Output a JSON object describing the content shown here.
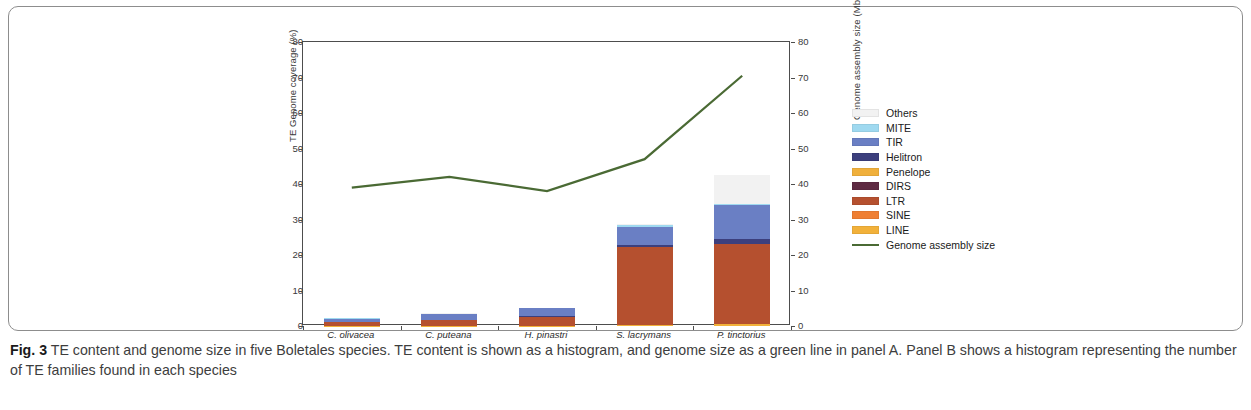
{
  "figure": {
    "caption_label": "Fig. 3",
    "caption_text": " TE content and genome size in five Boletales species. TE content is shown as a histogram, and genome size as a green line in panel A. Panel B shows a histogram representing the number of TE families found in each species"
  },
  "legend": {
    "items": [
      {
        "label": "Others",
        "color": "#f2f2f2"
      },
      {
        "label": "MITE",
        "color": "#9fd9f0"
      },
      {
        "label": "TIR",
        "color": "#6a7fc4"
      },
      {
        "label": "Helitron",
        "color": "#3c3f7d"
      },
      {
        "label": "Penelope",
        "color": "#f0b03c"
      },
      {
        "label": "DIRS",
        "color": "#5e2a42"
      },
      {
        "label": "LTR",
        "color": "#b5502f"
      },
      {
        "label": "SINE",
        "color": "#ef7f33"
      },
      {
        "label": "LINE",
        "color": "#f2b13a"
      },
      {
        "label": "Genome assembly size",
        "color": "#4a6a34"
      }
    ]
  },
  "chart_data": {
    "type": "bar",
    "title": "",
    "xlabel": "",
    "ylabel": "TE Genome coverage (%)",
    "y2label": "Genome assembly size (Mb)",
    "ylim": [
      0,
      80
    ],
    "y2lim": [
      0,
      80
    ],
    "yticks": [
      0,
      10,
      20,
      30,
      40,
      50,
      60,
      70,
      80
    ],
    "y2ticks": [
      0,
      10,
      20,
      30,
      40,
      50,
      60,
      70,
      80
    ],
    "grid": false,
    "legend_position": "right",
    "categories": [
      "C. olivacea",
      "C. puteana",
      "H. pinastri",
      "S. lacrymans",
      "P. tinctorius"
    ],
    "stack_order": [
      "LINE",
      "SINE",
      "LTR",
      "DIRS",
      "Penelope",
      "Helitron",
      "TIR",
      "MITE",
      "Others"
    ],
    "series": [
      {
        "name": "LINE",
        "color": "#f2b13a",
        "values": [
          0.05,
          0.05,
          0.1,
          0.15,
          0.6
        ]
      },
      {
        "name": "SINE",
        "color": "#ef7f33",
        "values": [
          0.02,
          0.02,
          0.03,
          0.05,
          0.1
        ]
      },
      {
        "name": "LTR",
        "color": "#b5502f",
        "values": [
          1.1,
          1.5,
          2.5,
          22.0,
          22.4
        ]
      },
      {
        "name": "DIRS",
        "color": "#5e2a42",
        "values": [
          0.02,
          0.02,
          0.03,
          0.05,
          0.1
        ]
      },
      {
        "name": "Penelope",
        "color": "#f0b03c",
        "values": [
          0.02,
          0.02,
          0.03,
          0.05,
          0.05
        ]
      },
      {
        "name": "Helitron",
        "color": "#3c3f7d",
        "values": [
          0.05,
          0.1,
          0.1,
          0.4,
          1.2
        ]
      },
      {
        "name": "TIR",
        "color": "#6a7fc4",
        "values": [
          0.8,
          1.7,
          2.2,
          5.3,
          9.6
        ]
      },
      {
        "name": "MITE",
        "color": "#9fd9f0",
        "values": [
          0.1,
          0.1,
          0.1,
          0.5,
          0.3
        ]
      },
      {
        "name": "Others",
        "color": "#f2f2f2",
        "values": [
          0.05,
          0.05,
          0.1,
          0.2,
          8.2
        ]
      }
    ],
    "totals": [
      2.2,
      3.6,
      5.2,
      28.7,
      42.5
    ],
    "line_series": {
      "name": "Genome assembly size",
      "color": "#4a6a34",
      "unit": "Mb",
      "values": [
        39.0,
        42.0,
        38.0,
        47.0,
        70.5
      ]
    }
  }
}
